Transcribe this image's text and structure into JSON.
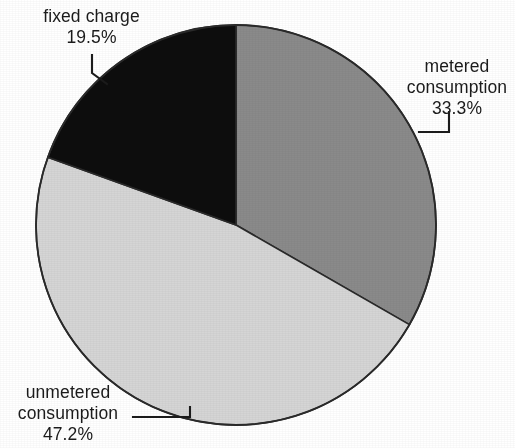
{
  "chart_data": {
    "type": "pie",
    "title": "",
    "subtitle": "",
    "xlabel": "",
    "ylabel": "",
    "legend_position": "none",
    "grid": false,
    "units": "percent",
    "start_angle_deg": 0,
    "direction": "clockwise",
    "total": 100.0,
    "categories": [
      "metered consumption",
      "unmetered consumption",
      "fixed charge"
    ],
    "values": [
      33.3,
      47.2,
      19.5
    ],
    "colors": [
      "#8a8a8a",
      "#d5d5d5",
      "#0d0d0d"
    ],
    "slices": [
      {
        "name": "metered consumption",
        "label_line1": "metered",
        "label_line2": "consumption",
        "value": 33.3,
        "value_label": "33.3%",
        "color": "#8a8a8a",
        "start_deg": 0.0,
        "end_deg": 119.88
      },
      {
        "name": "unmetered consumption",
        "label_line1": "unmetered",
        "label_line2": "consumption",
        "value": 47.2,
        "value_label": "47.2%",
        "color": "#d5d5d5",
        "start_deg": 119.88,
        "end_deg": 289.8
      },
      {
        "name": "fixed charge",
        "label_line1": "fixed charge",
        "label_line2": "",
        "value": 19.5,
        "value_label": "19.5%",
        "color": "#0d0d0d",
        "start_deg": 289.8,
        "end_deg": 360.0
      }
    ]
  },
  "figure": {
    "background_color": "#ffffff",
    "outline_color": "#2a2a2a",
    "text_color": "#1b1b1b",
    "leader_color": "#1b1b1b"
  },
  "labels": {
    "fixed_charge": {
      "line1": "fixed charge",
      "line2": "19.5%"
    },
    "metered": {
      "line1": "metered",
      "line2": "consumption",
      "line3": "33.3%"
    },
    "unmetered": {
      "line1": "unmetered",
      "line2": "consumption",
      "line3": "47.2%"
    }
  }
}
